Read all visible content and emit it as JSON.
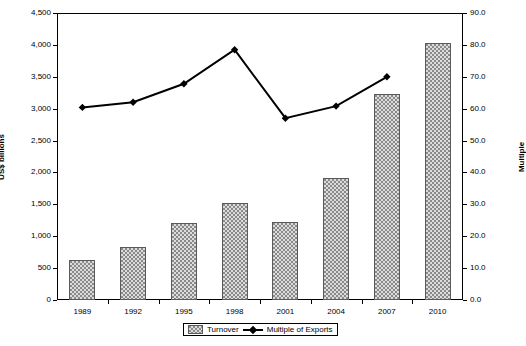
{
  "chart_data": {
    "type": "bar",
    "title": "",
    "subtitle": "",
    "categories": [
      "1989",
      "1992",
      "1995",
      "1998",
      "2001",
      "2004",
      "2007",
      "2010"
    ],
    "xlabel": "",
    "ylabel": "US$ billions",
    "y2label": "Multiple",
    "ylim": [
      0,
      4500
    ],
    "y2lim": [
      0,
      90
    ],
    "grid": false,
    "legend_position": "bottom",
    "left_axis": {
      "label": "US$ billions",
      "min": 0,
      "max": 4500,
      "step": 500,
      "ticks": [
        "0",
        "500",
        "1,000",
        "1,500",
        "2,000",
        "2,500",
        "3,000",
        "3,500",
        "4,000",
        "4,500"
      ]
    },
    "right_axis": {
      "label": "Multiple",
      "min": 0,
      "max": 90,
      "step": 10,
      "ticks": [
        "0.0",
        "10.0",
        "20.0",
        "30.0",
        "40.0",
        "50.0",
        "60.0",
        "70.0",
        "80.0",
        "90.0"
      ]
    },
    "series": [
      {
        "name": "Turnover",
        "type": "bar",
        "axis": "left",
        "unit": "US$ billions",
        "values": [
          620,
          830,
          1210,
          1520,
          1220,
          1910,
          3230,
          4030
        ]
      },
      {
        "name": "Multiple of Exports",
        "type": "line",
        "axis": "right",
        "unit": "Multiple",
        "values": [
          60.4,
          62.0,
          67.8,
          78.5,
          57.0,
          60.8,
          70.0,
          null
        ],
        "marker": "diamond"
      }
    ],
    "legend": [
      {
        "label": "Turnover",
        "marker": "bar-swatch"
      },
      {
        "label": "Multiple of Exports",
        "marker": "line-diamond"
      }
    ],
    "colors": {
      "bar_fill": "#dcdcdc",
      "bar_pattern": "#8a8a8a",
      "bar_border": "#5a5a5a",
      "line": "#000000",
      "axis": "#000000",
      "background": "#ffffff"
    }
  }
}
